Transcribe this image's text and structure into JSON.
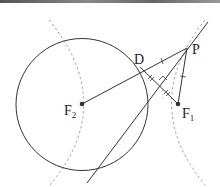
{
  "diagram": {
    "type": "geometry",
    "labels": {
      "P": "P",
      "D": "D",
      "F2_main": "F",
      "F2_sub": "2",
      "F1_main": "F",
      "F1_sub": "1"
    },
    "points": {
      "F2": [
        82,
        104
      ],
      "F1": [
        178,
        104
      ],
      "P": [
        187,
        48
      ],
      "D": [
        140,
        67
      ],
      "foot": [
        162,
        84
      ]
    },
    "circle": {
      "center": [
        82,
        104
      ],
      "radius": 66
    },
    "tangent_line": {
      "from": [
        87,
        183
      ],
      "to": [
        208,
        22
      ]
    },
    "colors": {
      "stroke": "#333333",
      "dashed": "#999999",
      "background": "#ffffff"
    }
  }
}
